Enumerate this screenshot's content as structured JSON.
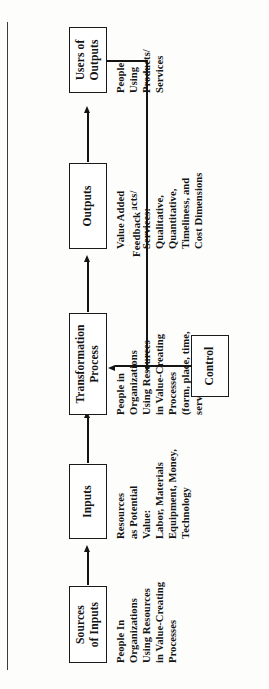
{
  "figure": {
    "type": "process-flow-diagram",
    "orientation": "rotated-90-counterclockwise",
    "nodes": [
      {
        "id": "sources-of-inputs",
        "title": "Sources\nof Inputs",
        "description": "People In\nOrganizations\nUsing Resources\nin Value-Creating\nProcesses"
      },
      {
        "id": "inputs",
        "title": "Inputs",
        "description": "Resources\nas Potential\nValue:\nLabor, Materials\nEquipment, Money,\nTechnology"
      },
      {
        "id": "transformation-process",
        "title": "Transformation\nProcess",
        "description": "People in\nOrganizations\nUsing Resources\nin Value-Creating\nProcesses\n(form, place, time,\nservice utilities)"
      },
      {
        "id": "outputs",
        "title": "Outputs",
        "description": "Value Added\nAs Products/\nServices:\nQualitative,\nQuantitative,\nTimeliness, and\nCost Dimensions"
      },
      {
        "id": "users-of-outputs",
        "title": "Users of\nOutputs",
        "description": "People\nUsing\nProducts/\nServices"
      },
      {
        "id": "control",
        "title": "Control",
        "description": ""
      }
    ],
    "feedback_label": "Feedback",
    "edges": [
      {
        "from": "sources-of-inputs",
        "to": "inputs"
      },
      {
        "from": "inputs",
        "to": "transformation-process"
      },
      {
        "from": "transformation-process",
        "to": "outputs"
      },
      {
        "from": "outputs",
        "to": "users-of-outputs"
      },
      {
        "from": "users-of-outputs",
        "to": "control",
        "label": "Feedback"
      },
      {
        "from": "control",
        "to": "transformation-process"
      }
    ],
    "colors": {
      "ink": "#141414",
      "paper": "#fdfdfb",
      "rule": "#3b3b3b"
    }
  }
}
